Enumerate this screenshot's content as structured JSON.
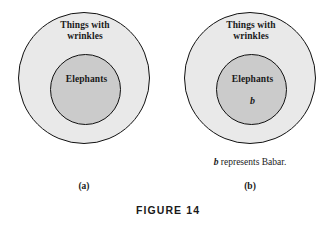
{
  "figure": {
    "caption": "FIGURE 14",
    "panels": [
      {
        "caption": "(a)",
        "outer_set": {
          "line1": "Things with",
          "line2": "wrinkles"
        },
        "inner_set": {
          "label": "Elephants"
        },
        "element": "",
        "note": ""
      },
      {
        "caption": "(b)",
        "outer_set": {
          "line1": "Things with",
          "line2": "wrinkles"
        },
        "inner_set": {
          "label": "Elephants"
        },
        "element": "b",
        "note_symbol": "b",
        "note_text": " represents Babar."
      }
    ]
  },
  "colors": {
    "outer_fill": "#e9e9e9",
    "inner_fill": "#cbcbcb",
    "stroke": "#111111",
    "text": "#1a1a1a",
    "background": "#ffffff"
  }
}
